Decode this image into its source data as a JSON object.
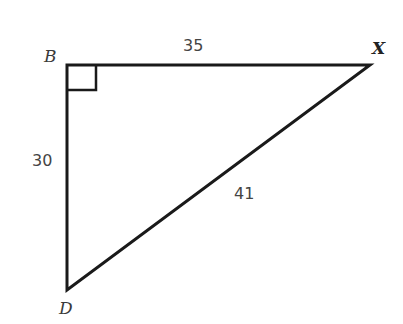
{
  "diagram": {
    "type": "right-triangle",
    "vertices": [
      {
        "label": "B",
        "x": 67,
        "y": 65,
        "right_angle": true
      },
      {
        "label": "X",
        "x": 370,
        "y": 65
      },
      {
        "label": "D",
        "x": 67,
        "y": 290
      }
    ],
    "sides": [
      {
        "between": "B-X",
        "length": "35"
      },
      {
        "between": "B-D",
        "length": "30"
      },
      {
        "between": "D-X",
        "length": "41"
      }
    ],
    "labels": {
      "B": "B",
      "X": "X",
      "D": "D",
      "side_bx": "35",
      "side_bd": "30",
      "side_dx": "41"
    },
    "stroke_color": "#1a1a1a"
  }
}
